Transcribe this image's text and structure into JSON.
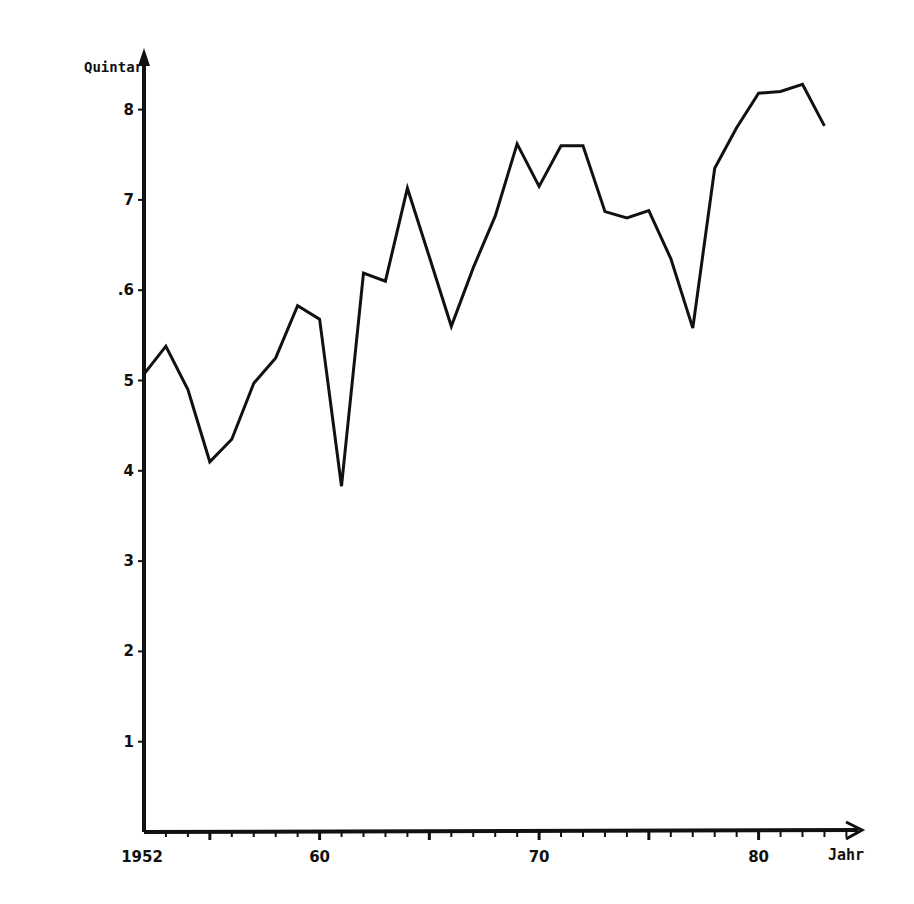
{
  "chart_data": {
    "type": "line",
    "title": "",
    "xlabel": "Jahr",
    "ylabel": "Quintar",
    "x_tick_labels": [
      "1952",
      "60",
      "70",
      "80"
    ],
    "y_tick_labels": [
      "1",
      "2",
      "3",
      "4",
      "5",
      ".6",
      "7",
      "8"
    ],
    "xlim": [
      1952,
      1985
    ],
    "ylim": [
      0,
      8.8
    ],
    "grid": false,
    "legend": null,
    "series": [
      {
        "name": "Quintar",
        "x": [
          1952,
          1953,
          1954,
          1955,
          1956,
          1957,
          1958,
          1959,
          1960,
          1961,
          1962,
          1963,
          1964,
          1965,
          1966,
          1967,
          1968,
          1969,
          1970,
          1971,
          1972,
          1973,
          1974,
          1975,
          1976,
          1977,
          1978,
          1979,
          1980,
          1981,
          1982,
          1983
        ],
        "values": [
          5.07,
          5.38,
          4.9,
          4.1,
          4.35,
          4.97,
          5.25,
          5.83,
          5.68,
          3.83,
          6.19,
          6.1,
          7.13,
          6.37,
          5.6,
          6.25,
          6.82,
          7.62,
          7.15,
          7.6,
          7.6,
          6.87,
          6.8,
          6.88,
          6.35,
          5.58,
          7.35,
          7.8,
          8.18,
          8.2,
          8.28,
          7.82
        ]
      }
    ],
    "colors": {
      "line": "#111111",
      "axis": "#111111",
      "background": "#ffffff"
    }
  }
}
